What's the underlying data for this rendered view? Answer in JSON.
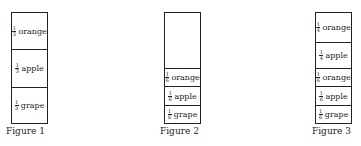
{
  "figures": [
    {
      "caption": "Figure 1",
      "cells": [
        {
          "num": "1",
          "den": "3",
          "label": "orange"
        },
        {
          "num": "1",
          "den": "3",
          "label": "apple"
        },
        {
          "num": "1",
          "den": "3",
          "label": "grape"
        }
      ]
    },
    {
      "caption": "Figure 2",
      "cells": [
        {
          "num": "1",
          "den": "6",
          "label": "orange"
        },
        {
          "num": "1",
          "den": "6",
          "label": "apple"
        },
        {
          "num": "1",
          "den": "6",
          "label": "grape"
        }
      ]
    },
    {
      "caption": "Figure 3",
      "cells": [
        {
          "num": "1",
          "den": "4",
          "label": "orange"
        },
        {
          "num": "1",
          "den": "4",
          "label": "apple"
        },
        {
          "num": "1",
          "den": "6",
          "label": "orange"
        },
        {
          "num": "1",
          "den": "6",
          "label": "apple"
        },
        {
          "num": "1",
          "den": "6",
          "label": "grape"
        }
      ]
    }
  ]
}
